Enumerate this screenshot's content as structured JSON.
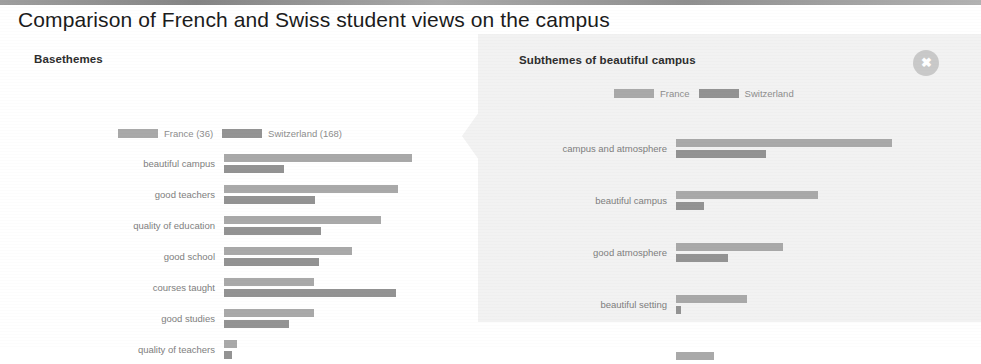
{
  "page": {
    "title": "Comparison of French and Swiss student views on the campus"
  },
  "left_panel": {
    "heading": "Basethemes",
    "legend": [
      {
        "label": "France (36)",
        "color": "#a9a9a9",
        "name": "france"
      },
      {
        "label": "Switzerland (168)",
        "color": "#939393",
        "name": "switzerland"
      }
    ]
  },
  "right_panel": {
    "heading": "Subthemes of beautiful campus",
    "close_label": "✖",
    "close_icon": "close-icon",
    "legend": [
      {
        "label": "France",
        "color": "#a9a9a9",
        "name": "france"
      },
      {
        "label": "Switzerland",
        "color": "#939393",
        "name": "switzerland"
      }
    ]
  },
  "chart_data": [
    {
      "type": "bar",
      "id": "basethemes",
      "title": "Basethemes",
      "orientation": "horizontal",
      "grouped": true,
      "xlabel": "",
      "ylabel": "",
      "grid": false,
      "legend_position": "top",
      "axis_unit": "pixels",
      "xlim": [
        0,
        200
      ],
      "categories": [
        "beautiful campus",
        "good teachers",
        "quality of education",
        "good school",
        "courses taught",
        "good studies",
        "quality of teachers"
      ],
      "series": [
        {
          "name": "France (36)",
          "color": "#a9a9a9",
          "values": [
            188,
            174,
            157,
            128,
            90,
            90,
            13
          ]
        },
        {
          "name": "Switzerland (168)",
          "color": "#939393",
          "values": [
            60,
            91,
            97,
            95,
            172,
            65,
            8
          ]
        }
      ]
    },
    {
      "type": "bar",
      "id": "subthemes-beautiful-campus",
      "title": "Subthemes of beautiful campus",
      "orientation": "horizontal",
      "grouped": true,
      "xlabel": "",
      "ylabel": "",
      "grid": false,
      "legend_position": "top",
      "axis_unit": "pixels",
      "xlim": [
        0,
        230
      ],
      "categories": [
        "campus and atmosphere",
        "beautiful campus",
        "good atmosphere",
        "beautiful setting"
      ],
      "series": [
        {
          "name": "France",
          "color": "#a9a9a9",
          "values": [
            216,
            142,
            107,
            71
          ]
        },
        {
          "name": "Switzerland",
          "color": "#939393",
          "values": [
            90,
            28,
            52,
            5
          ]
        }
      ],
      "truncated_row": {
        "label": "",
        "france": 38,
        "switzerland": 0,
        "note": "row cut off at bottom edge"
      }
    }
  ]
}
